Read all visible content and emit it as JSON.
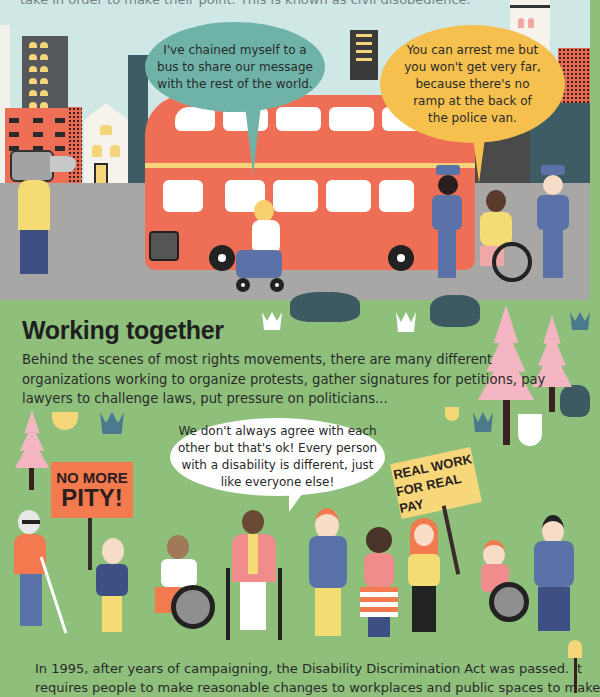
{
  "page": {
    "intro_fragment": "take in order to make their point. This is known as civil disobedience.",
    "colors": {
      "sky": "#cfe8e6",
      "road": "#a8a7a5",
      "grass": "#8ec07c",
      "bus_red": "#ef6f56",
      "bubble_teal": "#6fb3a8",
      "bubble_yellow": "#f5c04e",
      "bubble_white": "#ffffff",
      "sign_orange": "#f27a4e",
      "sign_yellow": "#f7d77a",
      "tree_pink": "#f3b6c2",
      "bush_dark": "#3d5a62"
    }
  },
  "scene_top": {
    "bubble_left": {
      "lines": [
        "I've chained myself to a",
        "bus to share our message",
        "with the rest of the world."
      ]
    },
    "bubble_right": {
      "lines": [
        "You can arrest me but",
        "you won't get very far,",
        "because there's no",
        "ramp at the back of",
        "the police van."
      ]
    }
  },
  "section": {
    "title": "Working together",
    "paragraph_lines": [
      "Behind the scenes of most rights movements, there are many different",
      "organizations working to organize protests, gather signatures for petitions, pay",
      "lawyers to challenge laws, put pressure on politicians..."
    ],
    "bubble_center": {
      "lines": [
        "We don't always agree with each",
        "other but that's ok! Every person",
        "with a disability is different, just",
        "like everyone else!"
      ]
    },
    "sign_left": {
      "lines": [
        "NO MORE",
        "PITY!"
      ]
    },
    "sign_right": {
      "lines": [
        "REAL WORK",
        "FOR REAL PAY"
      ]
    },
    "footer_lines": [
      "In 1995, after years of campaigning, the Disability Discrimination Act was passed. It",
      "requires people to make reasonable changes to workplaces and public spaces to make"
    ]
  }
}
